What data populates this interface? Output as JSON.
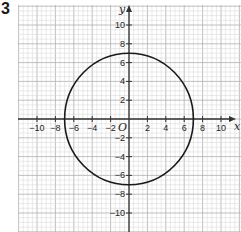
{
  "problem_number": "3",
  "chart_data": {
    "type": "line",
    "title": "",
    "xlabel": "x",
    "ylabel": "y",
    "origin_label": "O",
    "xlim": [
      -12,
      12
    ],
    "ylim": [
      -12,
      12
    ],
    "grid": true,
    "grid_minor_step": 0.5,
    "grid_major_step": 2,
    "x_ticks": [
      -10,
      -8,
      -6,
      -4,
      -2,
      2,
      4,
      6,
      8,
      10
    ],
    "y_ticks": [
      10,
      8,
      6,
      4,
      2,
      -2,
      -4,
      -6,
      -8,
      -10
    ],
    "x_tick_labels": [
      "−10",
      "−8",
      "−6",
      "−4",
      "−2",
      "2",
      "4",
      "6",
      "8",
      "10"
    ],
    "y_tick_labels": [
      "10",
      "8",
      "6",
      "4",
      "2",
      "−2",
      "−4",
      "−6",
      "−8",
      "−10"
    ],
    "series": [
      {
        "name": "circle",
        "shape": "circle",
        "center": [
          0,
          0
        ],
        "radius": 7,
        "equation": "x^2 + y^2 = 49"
      }
    ]
  },
  "colors": {
    "grid_minor": "#d4d4d4",
    "grid_major": "#b0b0b0",
    "axis": "#333333",
    "curve": "#1a1a1a"
  }
}
